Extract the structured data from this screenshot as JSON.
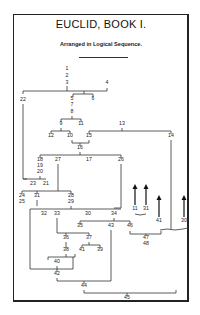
{
  "title": "EUCLID,  BOOK I.",
  "subtitle": "Arranged in Logical Sequence.",
  "nodes": [
    {
      "label": "1",
      "x": 67,
      "y": 70
    },
    {
      "label": "2",
      "x": 67,
      "y": 77
    },
    {
      "label": "3",
      "x": 67,
      "y": 84
    },
    {
      "label": "4",
      "x": 107,
      "y": 84
    },
    {
      "label": "22",
      "x": 23,
      "y": 101
    },
    {
      "label": "5",
      "x": 72,
      "y": 100
    },
    {
      "label": "6",
      "x": 93,
      "y": 100
    },
    {
      "label": "7",
      "x": 72,
      "y": 106
    },
    {
      "label": "8",
      "x": 72,
      "y": 113
    },
    {
      "label": "9",
      "x": 61,
      "y": 125
    },
    {
      "label": "11",
      "x": 81,
      "y": 125
    },
    {
      "label": "13",
      "x": 122,
      "y": 125
    },
    {
      "label": "12",
      "x": 51,
      "y": 137
    },
    {
      "label": "10",
      "x": 70,
      "y": 137
    },
    {
      "label": "15",
      "x": 89,
      "y": 137
    },
    {
      "label": "14",
      "x": 171,
      "y": 137
    },
    {
      "label": "16",
      "x": 80,
      "y": 149
    },
    {
      "label": "18",
      "x": 40,
      "y": 161
    },
    {
      "label": "27",
      "x": 58,
      "y": 161
    },
    {
      "label": "17",
      "x": 89,
      "y": 161
    },
    {
      "label": "26",
      "x": 121,
      "y": 161
    },
    {
      "label": "19",
      "x": 40,
      "y": 167
    },
    {
      "label": "20",
      "x": 40,
      "y": 173
    },
    {
      "label": "23",
      "x": 33,
      "y": 185
    },
    {
      "label": "21",
      "x": 46,
      "y": 185
    },
    {
      "label": "24",
      "x": 22,
      "y": 197
    },
    {
      "label": "31",
      "x": 37,
      "y": 197
    },
    {
      "label": "28",
      "x": 71,
      "y": 197
    },
    {
      "label": "25",
      "x": 22,
      "y": 203
    },
    {
      "label": "29",
      "x": 71,
      "y": 203
    },
    {
      "label": "32",
      "x": 44,
      "y": 215
    },
    {
      "label": "33",
      "x": 57,
      "y": 215
    },
    {
      "label": "30",
      "x": 88,
      "y": 215
    },
    {
      "label": "34",
      "x": 114,
      "y": 215
    },
    {
      "label": "11",
      "x": 135,
      "y": 210
    },
    {
      "label": "31",
      "x": 146,
      "y": 210
    },
    {
      "label": "35",
      "x": 80,
      "y": 227
    },
    {
      "label": "43",
      "x": 111,
      "y": 227
    },
    {
      "label": "46",
      "x": 130,
      "y": 227
    },
    {
      "label": "41",
      "x": 159,
      "y": 222
    },
    {
      "label": "30",
      "x": 184,
      "y": 222
    },
    {
      "label": "36",
      "x": 66,
      "y": 239
    },
    {
      "label": "37",
      "x": 89,
      "y": 239
    },
    {
      "label": "47",
      "x": 146,
      "y": 239
    },
    {
      "label": "48",
      "x": 146,
      "y": 245
    },
    {
      "label": "38",
      "x": 66,
      "y": 251
    },
    {
      "label": "41",
      "x": 82,
      "y": 251
    },
    {
      "label": "39",
      "x": 100,
      "y": 251
    },
    {
      "label": "40",
      "x": 57,
      "y": 263
    },
    {
      "label": "42",
      "x": 57,
      "y": 275
    },
    {
      "label": "44",
      "x": 84,
      "y": 287
    },
    {
      "label": "45",
      "x": 127,
      "y": 299
    }
  ]
}
